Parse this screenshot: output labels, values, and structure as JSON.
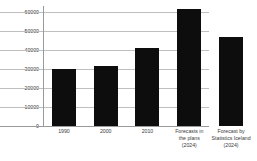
{
  "chart_data": {
    "type": "bar",
    "title": "",
    "subtitle": "",
    "xlabel": "",
    "ylabel": "",
    "categories": [
      "1990",
      "2000",
      "2010",
      "Forecasts in\nthe plans\n(2024)",
      "Forecast by\nStatistics Iceland\n(2024)"
    ],
    "values": [
      29800,
      31800,
      41000,
      61500,
      47000
    ],
    "ylim": [
      0,
      63000
    ],
    "yticks": [
      0,
      10000,
      20000,
      30000,
      40000,
      50000,
      60000
    ],
    "ytick_labels": [
      "0",
      "10000",
      "20000",
      "30000",
      "40000",
      "50000",
      "60000"
    ],
    "grid": true,
    "legend": false,
    "legend_position": "none",
    "bar_color": "#0d0d0d",
    "gridline_color": "#bfbfbf",
    "axis_color": "#9a9a9a",
    "text_color": "#3a3a3a",
    "background_color": "#ffffff"
  }
}
